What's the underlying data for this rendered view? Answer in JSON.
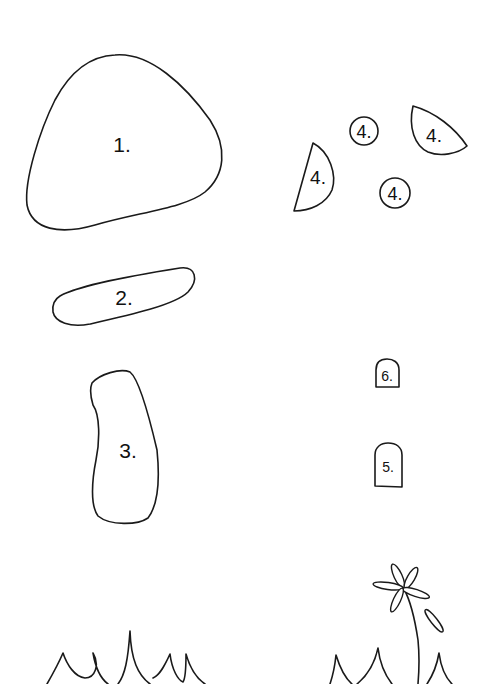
{
  "pieces": [
    {
      "id": "1",
      "label": "1."
    },
    {
      "id": "2",
      "label": "2."
    },
    {
      "id": "3",
      "label": "3."
    },
    {
      "id": "4a",
      "label": "4."
    },
    {
      "id": "4b",
      "label": "4."
    },
    {
      "id": "4c",
      "label": "4."
    },
    {
      "id": "4d",
      "label": "4."
    },
    {
      "id": "5",
      "label": "5."
    },
    {
      "id": "6",
      "label": "6."
    }
  ],
  "colors": {
    "stroke": "#1a1a1a",
    "background": "#ffffff"
  }
}
